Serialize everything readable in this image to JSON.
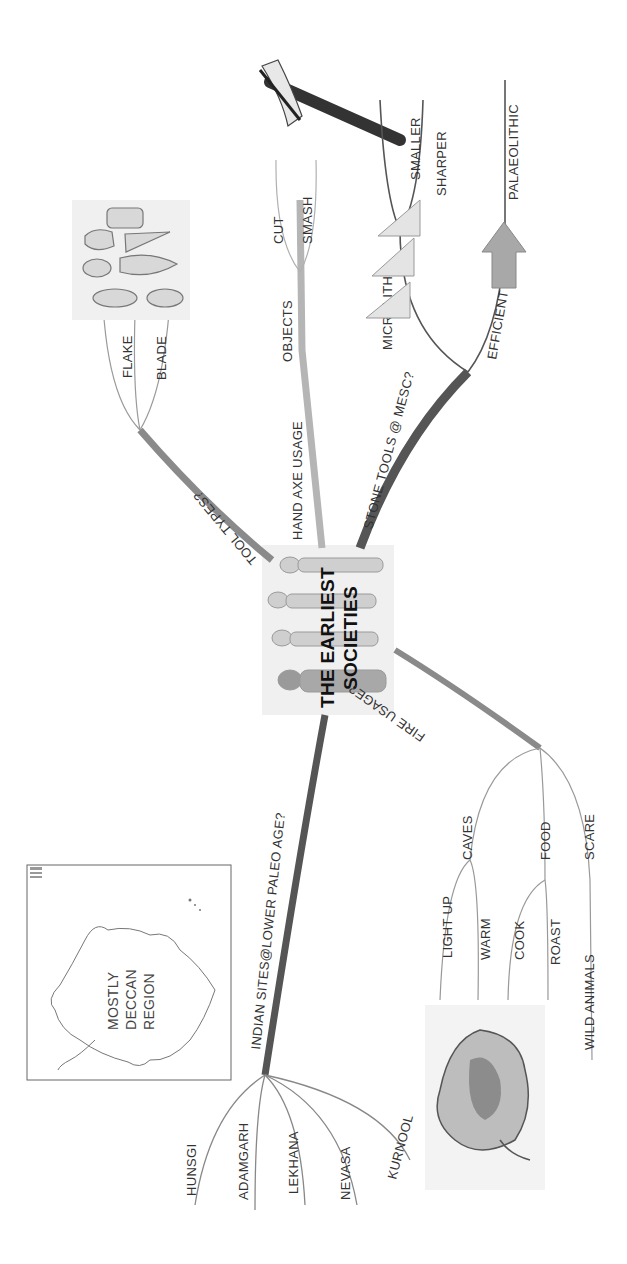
{
  "central_topic": {
    "line1": "THE EARLIEST",
    "line2": "SOCIETIES"
  },
  "branches": {
    "tool_types": {
      "label": "TOOL TYPES?",
      "children": [
        "CORE",
        "FLAKE",
        "BLADE"
      ]
    },
    "hand_axe_usage": {
      "label": "HAND AXE USAGE",
      "child": "OBJECTS",
      "grandchildren": [
        "CUT",
        "SMASH"
      ]
    },
    "stone_tools": {
      "label": "STONE TOOLS @ MESC?",
      "microliths": {
        "label": "MICROLITHS",
        "children": [
          "SMALLER",
          "SHARPER"
        ]
      },
      "efficient": {
        "label": "EFFICIENT",
        "children": [
          "PALAEOLITHIC"
        ]
      }
    },
    "fire_usage": {
      "label": "FIRE USAGE?",
      "caves": {
        "label": "CAVES",
        "children": [
          "LIGHT UP",
          "WARM"
        ]
      },
      "food": {
        "label": "FOOD",
        "children": [
          "COOK",
          "ROAST"
        ]
      },
      "scare": {
        "label": "SCARE",
        "children": [
          "WILD ANIMALS"
        ]
      }
    },
    "indian_sites": {
      "label": "INDIAN SITES@LOWER PALEO AGE?",
      "children": [
        "HUNSGI",
        "ADAMGARH",
        "LEKHANA",
        "NEVASA",
        "KURNOOL"
      ]
    }
  },
  "images": {
    "map_label": [
      "MOSTLY",
      "DECCAN",
      "REGION"
    ],
    "stone_tools_illustration": "stone-tools-sketch",
    "hand_axe_illustration": "axe-sketch",
    "microliths_illustration": "microliths-sketch",
    "fire_illustration": "fire-sketch",
    "humans_illustration": "human-evolution-sketch"
  },
  "colors": {
    "background": "#ffffff",
    "branch_dark": "#555555",
    "branch_mid": "#8a8a8a",
    "branch_light": "#b5b5b5",
    "text": "#333333"
  }
}
